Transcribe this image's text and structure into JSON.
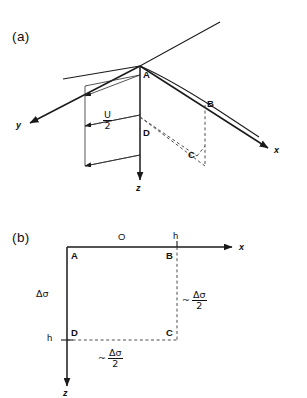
{
  "figure": {
    "panels": [
      {
        "id": "a",
        "tag": "(a)",
        "axes": [
          {
            "name": "y",
            "label": "y"
          },
          {
            "name": "x",
            "label": "x"
          },
          {
            "name": "z",
            "label": "z"
          }
        ],
        "points": [
          {
            "name": "A",
            "label": "A"
          },
          {
            "name": "B",
            "label": "B"
          },
          {
            "name": "C",
            "label": "C"
          },
          {
            "name": "D",
            "label": "D"
          }
        ],
        "velocity_label": {
          "numerator": "U",
          "denominator": "2"
        }
      },
      {
        "id": "b",
        "tag": "(b)",
        "axes": [
          {
            "name": "x",
            "label": "x"
          },
          {
            "name": "z",
            "label": "z"
          }
        ],
        "points": [
          {
            "name": "A",
            "label": "A"
          },
          {
            "name": "B",
            "label": "B"
          },
          {
            "name": "C",
            "label": "C"
          },
          {
            "name": "D",
            "label": "D"
          }
        ],
        "origin_label": "O",
        "tick_top": "h",
        "tick_left": "h",
        "stress_label": "Δσ",
        "annotation_right": {
          "approx": "~",
          "numerator": "Δσ",
          "denominator": "2"
        },
        "annotation_bottom": {
          "approx": "~",
          "numerator": "Δσ",
          "denominator": "2"
        }
      }
    ],
    "colors": {
      "ink": "#1a1a1a",
      "dashed": "#3a3a3a",
      "background": "#ffffff"
    }
  }
}
